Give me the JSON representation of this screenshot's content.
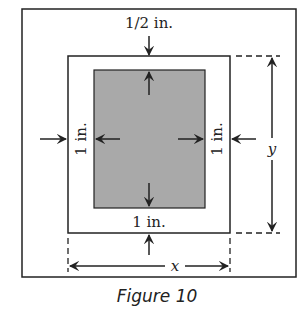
{
  "figure": {
    "caption": "Figure 10",
    "labels": {
      "top_margin": "1/2 in.",
      "bottom_margin": "1 in.",
      "left_margin": "1 in.",
      "right_margin": "1 in.",
      "width_var": "x",
      "height_var": "y"
    },
    "colors": {
      "line": "#222222",
      "printed_area": "#a9a9a9",
      "background": "#ffffff"
    }
  }
}
